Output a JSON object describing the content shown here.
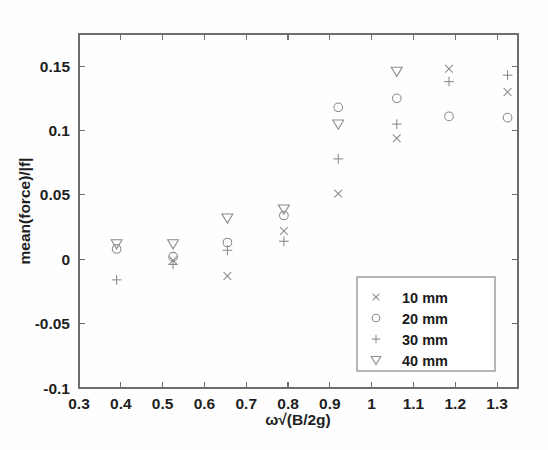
{
  "chart_data": {
    "type": "scatter",
    "title": "",
    "xlabel": "ω√(B/2g)",
    "ylabel": "mean(force)/|f|",
    "xlim": [
      0.3,
      1.35
    ],
    "ylim": [
      -0.1,
      0.175
    ],
    "xticks": [
      0.3,
      0.4,
      0.5,
      0.6,
      0.7,
      0.8,
      0.9,
      1.0,
      1.1,
      1.2,
      1.3
    ],
    "xticklabels": [
      "0.3",
      "0.4",
      "0.5",
      "0.6",
      "0.7",
      "0.8",
      "0.9",
      "1",
      "1.1",
      "1.2",
      "1.3"
    ],
    "yticks": [
      -0.1,
      -0.05,
      0,
      0.05,
      0.1,
      0.15
    ],
    "yticklabels": [
      "-0.1",
      "-0.05",
      "0",
      "0.05",
      "0.1",
      "0.15"
    ],
    "grid": false,
    "legend_position": "lower right",
    "series": [
      {
        "name": "10 mm",
        "marker": "x",
        "x": [
          0.525,
          0.655,
          0.79,
          0.92,
          1.06,
          1.185,
          1.325
        ],
        "y": [
          -0.001,
          -0.013,
          0.022,
          0.051,
          0.094,
          0.148,
          0.13
        ]
      },
      {
        "name": "20 mm",
        "marker": "o",
        "x": [
          0.39,
          0.525,
          0.655,
          0.79,
          0.92,
          1.06,
          1.185,
          1.325
        ],
        "y": [
          0.008,
          0.002,
          0.013,
          0.034,
          0.118,
          0.125,
          0.111,
          0.11
        ]
      },
      {
        "name": "30 mm",
        "marker": "+",
        "x": [
          0.39,
          0.525,
          0.655,
          0.79,
          0.92,
          1.06,
          1.185,
          1.325
        ],
        "y": [
          -0.016,
          -0.004,
          0.007,
          0.014,
          0.078,
          0.105,
          0.138,
          0.143
        ]
      },
      {
        "name": "40 mm",
        "marker": "v",
        "x": [
          0.39,
          0.525,
          0.655,
          0.79,
          0.92,
          1.06
        ],
        "y": [
          0.012,
          0.012,
          0.032,
          0.039,
          0.105,
          0.146
        ]
      }
    ]
  },
  "legend": {
    "entries": [
      {
        "marker": "x",
        "label": "10 mm"
      },
      {
        "marker": "o",
        "label": "20 mm"
      },
      {
        "marker": "+",
        "label": "30 mm"
      },
      {
        "marker": "v",
        "label": "40 mm"
      }
    ]
  }
}
